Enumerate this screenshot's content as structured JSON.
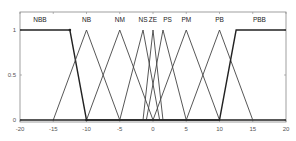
{
  "chart_data": {
    "type": "line",
    "title": "",
    "xlabel": "",
    "ylabel": "",
    "xlim": [
      -20,
      20
    ],
    "ylim": [
      0,
      1
    ],
    "grid": false,
    "legend_position": "top (inline labels)",
    "x_ticks": [
      -20,
      -15,
      -10,
      -5,
      0,
      5,
      10,
      15,
      20
    ],
    "x_tick_labels": [
      "-20",
      "-15",
      "-10",
      "-5",
      "0",
      "5",
      "10",
      "15",
      "20"
    ],
    "y_ticks": [
      0,
      0.5,
      1
    ],
    "y_tick_labels": [
      "0",
      "0.5",
      "1"
    ],
    "series": [
      {
        "name": "NBB",
        "shape": "z",
        "points": [
          [
            -20,
            1
          ],
          [
            -12.5,
            1
          ],
          [
            -10,
            0
          ],
          [
            20,
            0
          ]
        ]
      },
      {
        "name": "NB",
        "shape": "triangle",
        "points": [
          [
            -15,
            0
          ],
          [
            -10,
            1
          ],
          [
            -5,
            0
          ]
        ]
      },
      {
        "name": "NM",
        "shape": "triangle",
        "points": [
          [
            -10,
            0
          ],
          [
            -5,
            1
          ],
          [
            0,
            0
          ]
        ]
      },
      {
        "name": "NS",
        "shape": "triangle",
        "points": [
          [
            -5,
            0
          ],
          [
            -1.5,
            1
          ],
          [
            1,
            0
          ]
        ]
      },
      {
        "name": "ZE",
        "shape": "triangle",
        "points": [
          [
            -1.5,
            0
          ],
          [
            0,
            1
          ],
          [
            1.5,
            0
          ]
        ]
      },
      {
        "name": "PS",
        "shape": "triangle",
        "points": [
          [
            -1,
            0
          ],
          [
            1.5,
            1
          ],
          [
            5,
            0
          ]
        ]
      },
      {
        "name": "PM",
        "shape": "triangle",
        "points": [
          [
            0,
            0
          ],
          [
            5,
            1
          ],
          [
            10,
            0
          ]
        ]
      },
      {
        "name": "PB",
        "shape": "triangle",
        "points": [
          [
            5,
            0
          ],
          [
            10,
            1
          ],
          [
            15,
            0
          ]
        ]
      },
      {
        "name": "PBB",
        "shape": "s",
        "points": [
          [
            -20,
            0
          ],
          [
            10,
            0
          ],
          [
            12.5,
            1
          ],
          [
            20,
            1
          ]
        ]
      }
    ],
    "label_positions_x": {
      "NBB": -17,
      "NB": -10,
      "NM": -5,
      "NS": -1.5,
      "ZE": 0,
      "PS": 2.2,
      "PM": 5,
      "PB": 10,
      "PBB": 16
    }
  }
}
